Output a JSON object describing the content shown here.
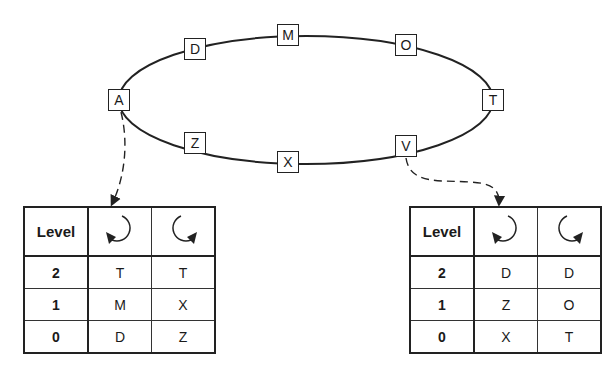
{
  "ring": {
    "nodes": [
      {
        "id": "D",
        "label": "D",
        "x": 195,
        "y": 49
      },
      {
        "id": "M",
        "label": "M",
        "x": 288,
        "y": 35
      },
      {
        "id": "O",
        "label": "O",
        "x": 406,
        "y": 45
      },
      {
        "id": "A",
        "label": "A",
        "x": 119,
        "y": 100
      },
      {
        "id": "T",
        "label": "T",
        "x": 493,
        "y": 100
      },
      {
        "id": "Z",
        "label": "Z",
        "x": 195,
        "y": 143
      },
      {
        "id": "X",
        "label": "X",
        "x": 288,
        "y": 162
      },
      {
        "id": "V",
        "label": "V",
        "x": 406,
        "y": 146
      }
    ]
  },
  "tables": [
    {
      "for_node": "A",
      "header": {
        "level": "Level",
        "col1_icon": "counterclockwise-arrow-icon",
        "col2_icon": "clockwise-arrow-icon"
      },
      "rows": [
        {
          "level": "2",
          "ccw": "T",
          "cw": "T"
        },
        {
          "level": "1",
          "ccw": "M",
          "cw": "X"
        },
        {
          "level": "0",
          "ccw": "D",
          "cw": "Z"
        }
      ]
    },
    {
      "for_node": "V",
      "header": {
        "level": "Level",
        "col1_icon": "counterclockwise-arrow-icon",
        "col2_icon": "clockwise-arrow-icon"
      },
      "rows": [
        {
          "level": "2",
          "ccw": "D",
          "cw": "D"
        },
        {
          "level": "1",
          "ccw": "Z",
          "cw": "O"
        },
        {
          "level": "0",
          "ccw": "X",
          "cw": "T"
        }
      ]
    }
  ],
  "colors": {
    "stroke": "#222222",
    "background": "#ffffff"
  }
}
